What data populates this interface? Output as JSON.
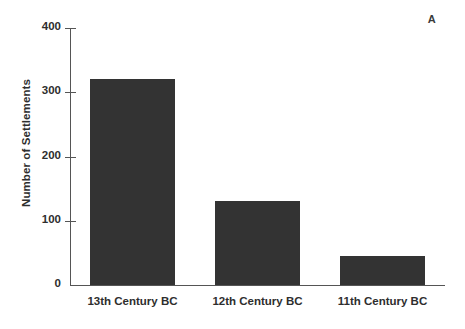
{
  "figure": {
    "panel_label": "A"
  },
  "chart_data": {
    "type": "bar",
    "title": "",
    "xlabel": "",
    "ylabel": "Number of Settlements",
    "categories": [
      "13th Century BC",
      "12th Century BC",
      "11th Century BC"
    ],
    "values": [
      320,
      130,
      45
    ],
    "ylim": [
      0,
      400
    ],
    "yticks": [
      0,
      100,
      200,
      300,
      400
    ],
    "ytick_labels": [
      "0",
      "100",
      "200",
      "300",
      "400"
    ],
    "grid": false,
    "legend": null,
    "bar_color": "#333333",
    "axis_color": "#555555",
    "text_color": "#2e2e2e"
  }
}
